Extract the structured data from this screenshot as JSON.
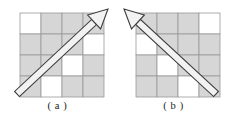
{
  "figure": {
    "background_color": "#ffffff",
    "grid": {
      "rows": 4,
      "cols": 4,
      "cell_size": 21,
      "filled_color": "#d6d6d6",
      "empty_color": "#ffffff",
      "line_color": "#9a9a9a",
      "line_width": 0.8
    },
    "arrow": {
      "outline_color": "#3c3c3c",
      "fill_color": "#f2f2f2",
      "line_width": 1.1,
      "shaft_width": 7,
      "head_length": 19,
      "head_width": 19
    },
    "panels": [
      {
        "id": "a",
        "caption": "( a )",
        "origin": {
          "x": 20,
          "y": 13
        },
        "cells": [
          [
            0,
            1,
            1,
            1
          ],
          [
            1,
            1,
            1,
            0
          ],
          [
            1,
            1,
            0,
            1
          ],
          [
            1,
            0,
            1,
            1
          ]
        ],
        "arrow_direction": "up-right",
        "arrow_start": {
          "x": 17,
          "y": 94
        },
        "arrow_end": {
          "x": 108,
          "y": 9
        }
      },
      {
        "id": "b",
        "caption": "( b )",
        "origin": {
          "x": 20,
          "y": 13
        },
        "cells": [
          [
            1,
            1,
            1,
            0
          ],
          [
            0,
            1,
            1,
            1
          ],
          [
            1,
            0,
            1,
            1
          ],
          [
            1,
            1,
            0,
            1
          ]
        ],
        "arrow_direction": "up-left",
        "arrow_start": {
          "x": 100,
          "y": 94
        },
        "arrow_end": {
          "x": 8,
          "y": 9
        }
      }
    ]
  }
}
